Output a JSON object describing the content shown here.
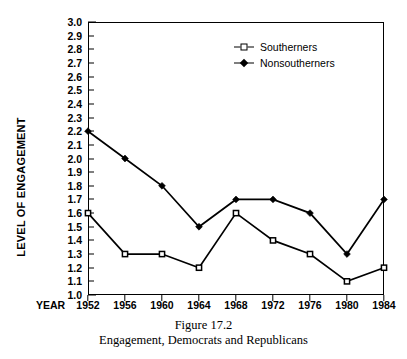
{
  "chart_data": {
    "type": "line",
    "title": "Figure 17.2",
    "subtitle": "Engagement, Democrats and Republicans",
    "xlabel": "YEAR",
    "ylabel": "LEVEL OF ENGAGEMENT",
    "categories": [
      "1952",
      "1956",
      "1960",
      "1964",
      "1968",
      "1972",
      "1976",
      "1980",
      "1984"
    ],
    "x": [
      1952,
      1956,
      1960,
      1964,
      1968,
      1972,
      1976,
      1980,
      1984
    ],
    "ylim": [
      1.0,
      3.0
    ],
    "ytick_step": 0.1,
    "yticks": [
      "3.0",
      "2.9",
      "2.8",
      "2.7",
      "2.6",
      "2.5",
      "2.4",
      "2.3",
      "2.2",
      "2.1",
      "2.0",
      "1.9",
      "1.8",
      "1.7",
      "1.6",
      "1.5",
      "1.4",
      "1.3",
      "1.2",
      "1.1",
      "1.0"
    ],
    "grid": false,
    "legend_position": "upper-right-inside",
    "series": [
      {
        "name": "Southerners",
        "marker": "open-square",
        "color": "#000000",
        "values": [
          1.6,
          1.3,
          1.3,
          1.2,
          1.6,
          1.4,
          1.3,
          1.1,
          1.2
        ]
      },
      {
        "name": "Nonsoutherners",
        "marker": "filled-diamond",
        "color": "#000000",
        "values": [
          2.2,
          2.0,
          1.8,
          1.5,
          1.7,
          1.7,
          1.6,
          1.3,
          1.7
        ]
      }
    ]
  },
  "legend": {
    "items": [
      {
        "label": "Southerners",
        "marker": "open-square"
      },
      {
        "label": "Nonsoutherners",
        "marker": "filled-diamond"
      }
    ]
  },
  "caption": {
    "title": "Figure 17.2",
    "subtitle": "Engagement, Democrats and Republicans"
  },
  "axes": {
    "y_title": "LEVEL OF ENGAGEMENT",
    "x_title": "YEAR"
  },
  "colors": {
    "ink": "#000000",
    "background": "#ffffff"
  }
}
